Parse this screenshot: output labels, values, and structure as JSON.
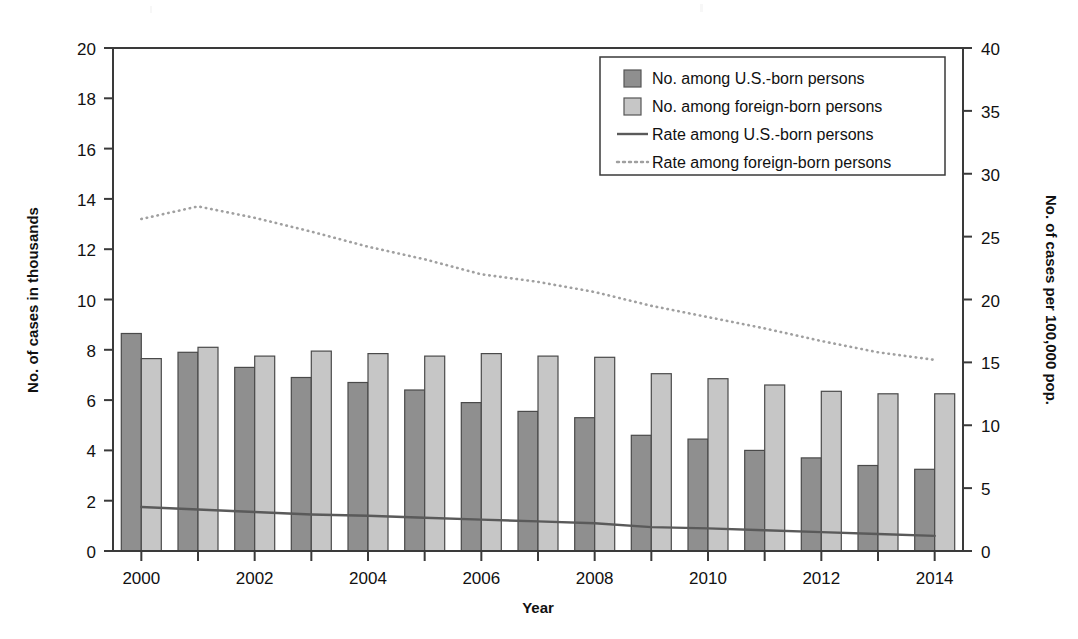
{
  "chart_data": {
    "type": "bar",
    "title": "",
    "xlabel": "Year",
    "ylabel": "No. of cases in thousands",
    "ylabel_right": "No. of cases per 100,000 pop.",
    "categories": [
      2000,
      2001,
      2002,
      2003,
      2004,
      2005,
      2006,
      2007,
      2008,
      2009,
      2010,
      2011,
      2012,
      2013,
      2014
    ],
    "x_tick_labels": [
      "2000",
      "",
      "2002",
      "",
      "2004",
      "",
      "2006",
      "",
      "2008",
      "",
      "2010",
      "",
      "2012",
      "",
      "2014"
    ],
    "ylim": [
      0,
      20
    ],
    "y_ticks": [
      0,
      2,
      4,
      6,
      8,
      10,
      12,
      14,
      16,
      18,
      20
    ],
    "ylim_right": [
      0,
      40
    ],
    "y_ticks_right": [
      0,
      5,
      10,
      15,
      20,
      25,
      30,
      35,
      40
    ],
    "grid": false,
    "legend_position": "top-right",
    "series": [
      {
        "name": "No. among U.S.-born persons",
        "kind": "bar",
        "axis": "left",
        "color": "#8f8f8f",
        "values": [
          8.65,
          7.9,
          7.3,
          6.9,
          6.7,
          6.4,
          5.9,
          5.55,
          5.3,
          4.6,
          4.45,
          4.0,
          3.7,
          3.4,
          3.25
        ]
      },
      {
        "name": "No. among foreign-born persons",
        "kind": "bar",
        "axis": "left",
        "color": "#c6c6c6",
        "values": [
          7.65,
          8.1,
          7.75,
          7.95,
          7.85,
          7.75,
          7.85,
          7.75,
          7.7,
          7.05,
          6.85,
          6.6,
          6.35,
          6.25,
          6.25
        ]
      },
      {
        "name": "Rate among U.S.-born persons",
        "kind": "line",
        "axis": "right",
        "color": "#5a5a5a",
        "style": "solid",
        "values": [
          3.5,
          3.3,
          3.1,
          2.9,
          2.8,
          2.65,
          2.5,
          2.35,
          2.2,
          1.9,
          1.8,
          1.65,
          1.5,
          1.35,
          1.2
        ]
      },
      {
        "name": "Rate among foreign-born persons",
        "kind": "line",
        "axis": "right",
        "color": "#a0a0a0",
        "style": "dotted",
        "values": [
          26.4,
          27.4,
          26.5,
          25.4,
          24.2,
          23.2,
          22.0,
          21.4,
          20.6,
          19.5,
          18.6,
          17.7,
          16.7,
          15.8,
          15.2
        ]
      }
    ]
  },
  "legend": {
    "items": [
      {
        "label": "No. among U.S.-born persons",
        "marker": "swatch-dark"
      },
      {
        "label": "No. among foreign-born persons",
        "marker": "swatch-light"
      },
      {
        "label": "Rate among U.S.-born persons",
        "marker": "line-solid"
      },
      {
        "label": "Rate among foreign-born persons",
        "marker": "line-dotted"
      }
    ]
  },
  "colors": {
    "bar_usborn": "#8f8f8f",
    "bar_foreignborn": "#c6c6c6",
    "line_usborn": "#5a5a5a",
    "line_foreignborn": "#a0a0a0",
    "axis": "#3a3a3a"
  }
}
